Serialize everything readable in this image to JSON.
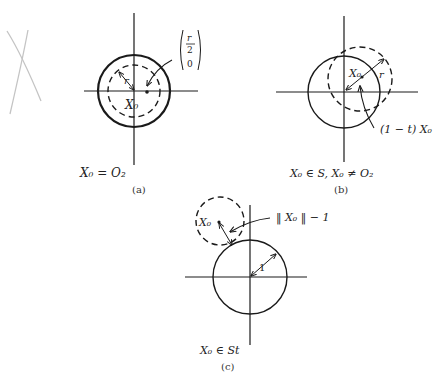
{
  "figure": {
    "panels": [
      {
        "id": "a",
        "caption": "(a)",
        "condition": "X₀ = O₂",
        "labels": {
          "radius": "r",
          "center": "X₀",
          "point_top": "r",
          "point_frac_den": "2",
          "point_bottom": "0"
        }
      },
      {
        "id": "b",
        "caption": "(b)",
        "condition": "X₀ ∈ S, X₀ ≠ O₂",
        "labels": {
          "center": "X₀",
          "radius": "r",
          "arrow_note": "(1 − t) X₀"
        }
      },
      {
        "id": "c",
        "caption": "(c)",
        "condition": "X₀ ∈ St",
        "labels": {
          "center": "X₀",
          "distance_note": "‖ X₀ ‖ − 1",
          "unit_radius": "1"
        }
      }
    ],
    "margin_mark": "X"
  },
  "colors": {
    "ink": "#1a1a1a",
    "pencil": "#bdbdbd",
    "background": "#ffffff"
  }
}
